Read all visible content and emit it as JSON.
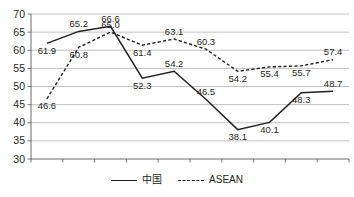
{
  "chart_data": {
    "type": "line",
    "title": "",
    "xlabel": "",
    "ylabel": "",
    "categories": [
      "2009",
      "2010",
      "2011",
      "2012",
      "2013",
      "2014",
      "2015",
      "2016",
      "2017",
      "2018"
    ],
    "ylim": [
      30,
      70
    ],
    "yticks": [
      30,
      35,
      40,
      45,
      50,
      55,
      60,
      65,
      70
    ],
    "grid": true,
    "legend_position": "bottom-center",
    "series": [
      {
        "name": "中国",
        "style": "solid",
        "color": "#231f20",
        "values": [
          61.9,
          65.2,
          66.6,
          52.3,
          54.2,
          46.5,
          38.1,
          40.1,
          48.3,
          48.7
        ],
        "labels": [
          "61.9",
          "65.2",
          "66.6",
          "52.3",
          "54.2",
          "46.5",
          "38.1",
          "40.1",
          "48.3",
          "48.7"
        ],
        "label_positions": [
          "below",
          "above",
          "above",
          "below",
          "above",
          "above",
          "below",
          "below",
          "below",
          "above"
        ]
      },
      {
        "name": "ASEAN",
        "style": "dashed",
        "color": "#231f20",
        "values": [
          46.6,
          60.8,
          65.0,
          61.4,
          63.1,
          60.3,
          54.2,
          55.4,
          55.7,
          57.4
        ],
        "labels": [
          "46.6",
          "60.8",
          "65.0",
          "61.4",
          "63.1",
          "60.3",
          "54.2",
          "55.4",
          "55.7",
          "57.4"
        ],
        "label_positions": [
          "below",
          "below",
          "above",
          "below",
          "above",
          "above",
          "below",
          "below",
          "below",
          "above"
        ]
      }
    ]
  },
  "legend": {
    "items": [
      {
        "label": "中国",
        "style": "solid"
      },
      {
        "label": "ASEAN",
        "style": "dashed"
      }
    ]
  }
}
